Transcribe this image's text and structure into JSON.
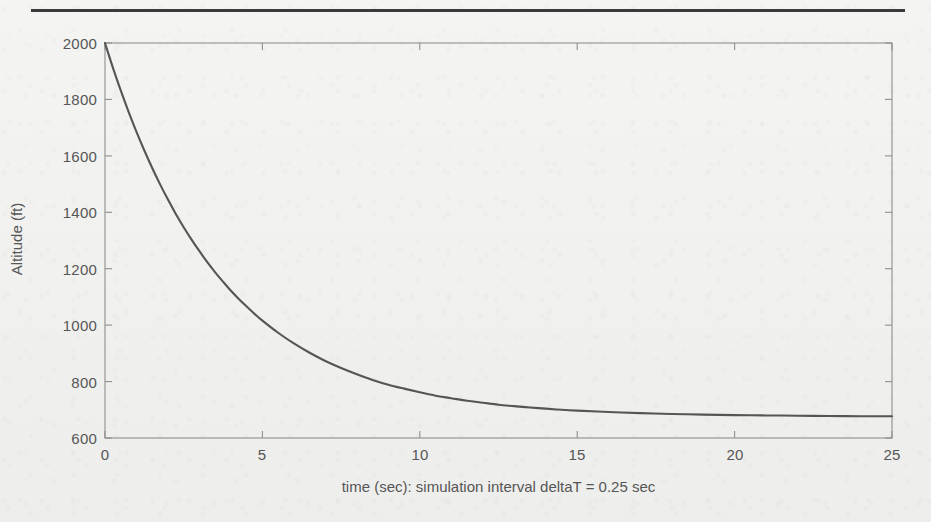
{
  "figure": {
    "background_color": "#f1f1ef",
    "rule_color": "#3a3a3a",
    "axis_color": "#8a8a8a",
    "line_color": "#555555",
    "text_color": "#565656"
  },
  "chart_data": {
    "type": "line",
    "title": "",
    "subtitle": "",
    "xlabel": "time (sec): simulation interval deltaT = 0.25 sec",
    "ylabel": "Altitude (ft)",
    "xlim": [
      0,
      25
    ],
    "ylim": [
      600,
      2000
    ],
    "xticks": [
      0,
      5,
      10,
      15,
      20,
      25
    ],
    "yticks": [
      600,
      800,
      1000,
      1200,
      1400,
      1600,
      1800,
      2000
    ],
    "xtick_labels": [
      "0",
      "5",
      "10",
      "15",
      "20",
      "25"
    ],
    "ytick_labels": [
      "600",
      "800",
      "1000",
      "1200",
      "1400",
      "1600",
      "1800",
      "2000"
    ],
    "grid": false,
    "legend": null,
    "legend_position": "none",
    "annotations": [],
    "series": [
      {
        "name": "Altitude",
        "x": [
          0,
          0.25,
          0.5,
          0.75,
          1,
          1.25,
          1.5,
          1.75,
          2,
          2.25,
          2.5,
          2.75,
          3,
          3.25,
          3.5,
          3.75,
          4,
          4.25,
          4.5,
          4.75,
          5,
          5.5,
          6,
          6.5,
          7,
          7.5,
          8,
          8.5,
          9,
          9.5,
          10,
          10.5,
          11,
          11.5,
          12,
          12.5,
          13,
          13.5,
          14,
          14.5,
          15,
          16,
          17,
          18,
          19,
          20,
          21,
          22,
          23,
          24,
          25
        ],
        "y": [
          2000,
          1913,
          1832,
          1756,
          1685,
          1619,
          1557,
          1499,
          1445,
          1394,
          1347,
          1303,
          1262,
          1223,
          1187,
          1154,
          1122,
          1093,
          1066,
          1040,
          1016,
          973,
          935,
          902,
          873,
          848,
          826,
          806,
          789,
          775,
          762,
          750,
          741,
          732,
          725,
          718,
          713,
          708,
          704,
          700,
          697,
          692,
          688,
          685,
          683,
          681,
          680,
          679,
          678,
          677,
          677
        ]
      }
    ],
    "asymptote": 677,
    "initial_value": 2000,
    "simulation_interval_sec": 0.25
  },
  "axis_labels": {
    "y_axis_title": "Altitude (ft)",
    "x_axis_title": "time (sec): simulation interval deltaT = 0.25 sec"
  }
}
